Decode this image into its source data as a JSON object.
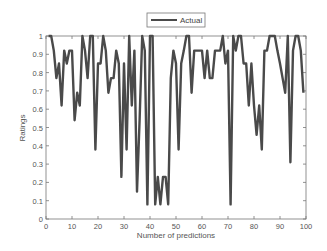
{
  "chart_data": {
    "type": "line",
    "title": "",
    "xlabel": "Number of predictions",
    "ylabel": "Ratings",
    "xlim": [
      0,
      100
    ],
    "ylim": [
      0,
      1
    ],
    "xticks": [
      0,
      10,
      20,
      30,
      40,
      50,
      60,
      70,
      80,
      90,
      100
    ],
    "yticks": [
      0,
      0.1,
      0.2,
      0.3,
      0.4,
      0.5,
      0.6,
      0.7,
      0.8,
      0.9,
      1
    ],
    "ytick_labels": [
      "0",
      "0.1",
      "0.2",
      "0.3",
      "0.4",
      "0.5",
      "0.6",
      "0.7",
      "0.8",
      "0.9",
      "1"
    ],
    "grid": false,
    "legend_position": "top-center",
    "series": [
      {
        "name": "Actual",
        "color": "#4a4a4a",
        "x": [
          1,
          2,
          3,
          4,
          5,
          6,
          7,
          8,
          9,
          10,
          11,
          12,
          13,
          14,
          15,
          16,
          17,
          18,
          19,
          20,
          21,
          22,
          23,
          24,
          25,
          26,
          27,
          28,
          29,
          30,
          31,
          32,
          33,
          34,
          35,
          36,
          37,
          38,
          39,
          40,
          41,
          42,
          43,
          44,
          45,
          46,
          47,
          48,
          49,
          50,
          51,
          52,
          53,
          54,
          55,
          56,
          57,
          58,
          59,
          60,
          61,
          62,
          63,
          64,
          65,
          66,
          67,
          68,
          69,
          70,
          71,
          72,
          73,
          74,
          75,
          76,
          77,
          78,
          79,
          80,
          81,
          82,
          83,
          84,
          85,
          86,
          87,
          88,
          89,
          90,
          91,
          92,
          93,
          94,
          95,
          96,
          97,
          98,
          99
        ],
        "values": [
          1,
          1,
          0.92,
          0.77,
          0.85,
          0.62,
          0.92,
          0.85,
          0.92,
          0.92,
          0.54,
          0.69,
          0.62,
          1,
          0.92,
          0.77,
          1,
          1,
          0.38,
          0.85,
          0.85,
          1,
          0.92,
          0.69,
          0.77,
          0.77,
          0.92,
          0.85,
          0.23,
          0.85,
          0.38,
          1,
          0.62,
          0.92,
          0.15,
          0.54,
          1,
          0.92,
          0.08,
          1,
          1,
          0.08,
          0.23,
          0.08,
          0.23,
          0.23,
          0.08,
          0.77,
          0.92,
          0.85,
          0.38,
          0.85,
          0.92,
          1,
          1,
          0.69,
          0.92,
          0.92,
          0.92,
          0.92,
          0.77,
          0.92,
          0.77,
          0.77,
          0.92,
          0.92,
          0.92,
          1,
          0.85,
          0.92,
          0.08,
          1,
          0.92,
          1,
          1,
          0.85,
          0.85,
          0.62,
          0.85,
          0.62,
          0.46,
          0.62,
          0.38,
          0.92,
          0.92,
          1,
          1,
          1,
          0.92,
          0.85,
          0.77,
          0.69,
          1,
          0.31,
          0.92,
          1,
          1,
          0.92,
          0.69
        ]
      }
    ]
  },
  "legend": {
    "label": "Actual"
  },
  "axes": {
    "xlabel": "Number of predictions",
    "ylabel": "Ratings"
  }
}
